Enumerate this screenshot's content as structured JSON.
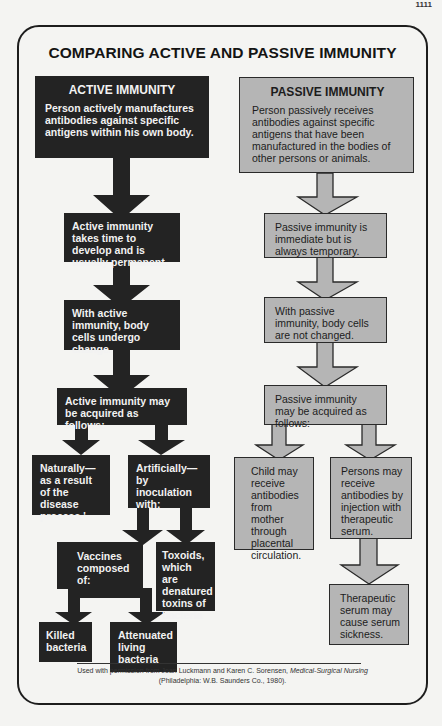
{
  "page_number": "1111",
  "title": "COMPARING ACTIVE AND PASSIVE IMMUNITY",
  "colors": {
    "active_fill": "#232323",
    "passive_fill": "#b5b5b5",
    "background": "#f4f4f2"
  },
  "active": {
    "heading": "ACTIVE IMMUNITY",
    "intro": "Person actively manufactures antibodies against specific antigens within his own body.",
    "step2": "Active immunity takes time to develop and is usually permanent.",
    "step3": "With active immunity, body cells undergo change.",
    "step4": "Active immunity may be acquired as follows:",
    "natural": "Naturally—as a result of the disease process.'",
    "artificial": "Artificially—by inoculation with:",
    "vaccines": "Vaccines composed of:",
    "toxoids": "Toxoids, which are denatured toxins of bacteria",
    "killed": "Killed bacteria",
    "attenuated": "Attenuated living bacteria"
  },
  "passive": {
    "heading": "PASSIVE IMMUNITY",
    "intro": "Person passively receives antibodies against specific antigens that have been manufactured in the bodies of other persons or animals.",
    "step2": "Passive immunity is immediate but is always temporary.",
    "step3": "With passive immunity, body cells are not changed.",
    "step4": "Passive immunity may be acquired as follows:",
    "mother": "Child may receive antibodies from mother through placental circulation.",
    "injection": "Persons may receive antibodies by injection with therapeutic serum.",
    "serum_sickness": "Therapeutic serum may cause serum sickness."
  },
  "credit": {
    "line1_prefix": "Used with permission from Joan Luckmann and Karen C. Sorensen, ",
    "book": "Medical-Surgical Nursing",
    "line2": "(Philadelphia: W.B. Saunders Co., 1980)."
  }
}
